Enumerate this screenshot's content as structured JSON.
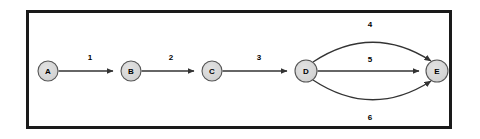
{
  "diagram": {
    "title": "",
    "type": "directed-graph",
    "frame": {
      "border_color": "#1a1a1a",
      "background_color": "#ffffff"
    },
    "style": {
      "node_fill": "#d4d4d4",
      "node_stroke": "#555555",
      "edge_color": "#333333",
      "label_color": "#000000"
    },
    "nodes": [
      {
        "id": "A",
        "label": "A",
        "cx": 48,
        "cy": 71,
        "r": 10
      },
      {
        "id": "B",
        "label": "B",
        "cx": 131,
        "cy": 71,
        "r": 10
      },
      {
        "id": "C",
        "label": "C",
        "cx": 212,
        "cy": 71,
        "r": 10
      },
      {
        "id": "D",
        "label": "D",
        "cx": 306,
        "cy": 71,
        "r": 11
      },
      {
        "id": "E",
        "label": "E",
        "cx": 437,
        "cy": 71,
        "r": 11
      }
    ],
    "edges": [
      {
        "from": "A",
        "to": "B",
        "label": "1",
        "shape": "straight",
        "label_x": 90,
        "label_y": 60
      },
      {
        "from": "B",
        "to": "C",
        "label": "2",
        "shape": "straight",
        "label_x": 171,
        "label_y": 60
      },
      {
        "from": "C",
        "to": "D",
        "label": "3",
        "shape": "straight",
        "label_x": 259,
        "label_y": 60
      },
      {
        "from": "D",
        "to": "E",
        "label": "4",
        "shape": "curve-up",
        "label_x": 370,
        "label_y": 27
      },
      {
        "from": "D",
        "to": "E",
        "label": "5",
        "shape": "straight",
        "label_x": 370,
        "label_y": 62
      },
      {
        "from": "D",
        "to": "E",
        "label": "6",
        "shape": "curve-down",
        "label_x": 370,
        "label_y": 120
      }
    ]
  }
}
